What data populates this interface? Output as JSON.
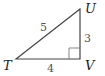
{
  "diagram": {
    "type": "right-triangle",
    "vertices": [
      {
        "name": "T",
        "x": 16,
        "y": 59
      },
      {
        "name": "U",
        "x": 80,
        "y": 9
      },
      {
        "name": "V",
        "x": 80,
        "y": 59
      }
    ],
    "right_angle_at": "V",
    "sides": [
      {
        "from": "T",
        "to": "U",
        "length_label": "5"
      },
      {
        "from": "U",
        "to": "V",
        "length_label": "3"
      },
      {
        "from": "T",
        "to": "V",
        "length_label": "4"
      }
    ],
    "labels": {
      "T": "T",
      "U": "U",
      "V": "V",
      "TU": "5",
      "UV": "3",
      "TV": "4"
    },
    "colors": {
      "line": "#444444",
      "vertex_label": "#222222",
      "side_label": "#555555"
    }
  }
}
